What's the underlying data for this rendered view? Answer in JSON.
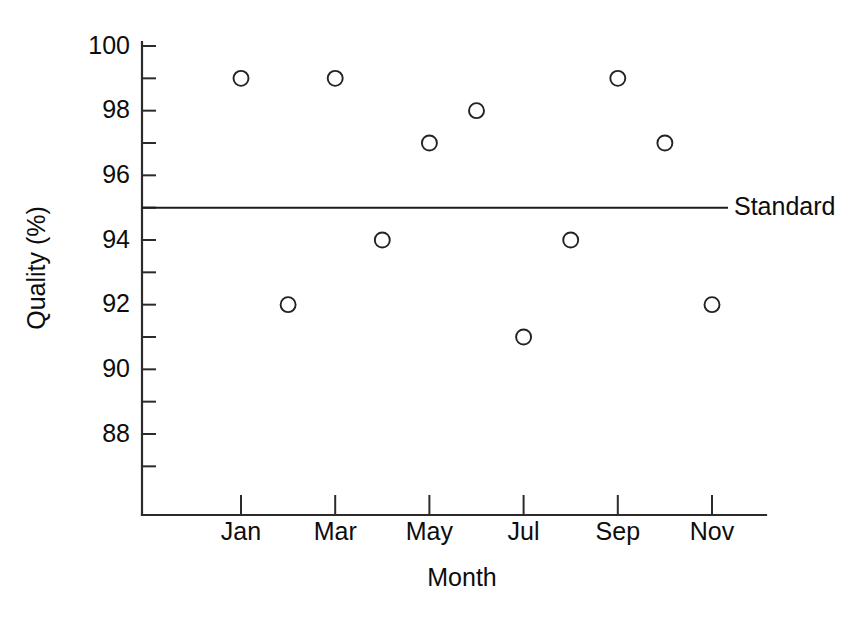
{
  "chart_data": {
    "type": "scatter",
    "title": "",
    "xlabel": "Month",
    "ylabel": "Quality (%)",
    "categories": [
      "Jan",
      "Feb",
      "Mar",
      "Apr",
      "May",
      "Jun",
      "Jul",
      "Aug",
      "Sep",
      "Oct",
      "Nov"
    ],
    "values": [
      99,
      92,
      99,
      94,
      97,
      98,
      91,
      94,
      99,
      97,
      92
    ],
    "series": [
      {
        "name": "Quality",
        "points": [
          {
            "month": "Jan",
            "month_index": 1,
            "value": 99
          },
          {
            "month": "Feb",
            "month_index": 2,
            "value": 92
          },
          {
            "month": "Mar",
            "month_index": 3,
            "value": 99
          },
          {
            "month": "Apr",
            "month_index": 4,
            "value": 94
          },
          {
            "month": "May",
            "month_index": 5,
            "value": 97
          },
          {
            "month": "Jun",
            "month_index": 6,
            "value": 98
          },
          {
            "month": "Jul",
            "month_index": 7,
            "value": 91
          },
          {
            "month": "Aug",
            "month_index": 8,
            "value": 94
          },
          {
            "month": "Sep",
            "month_index": 9,
            "value": 99
          },
          {
            "month": "Oct",
            "month_index": 10,
            "value": 97
          },
          {
            "month": "Nov",
            "month_index": 11,
            "value": 92
          }
        ]
      }
    ],
    "ylim": [
      86.8,
      100.4
    ],
    "xlim": [
      0.0,
      12.2
    ],
    "ytick_labels": [
      "88",
      "90",
      "92",
      "94",
      "96",
      "98",
      "100"
    ],
    "ytick_values": [
      88,
      90,
      92,
      94,
      96,
      98,
      100
    ],
    "yminor_values": [
      87,
      89,
      91,
      93,
      95,
      97,
      99
    ],
    "xtick_labels": [
      "Jan",
      "Mar",
      "May",
      "Jul",
      "Sep",
      "Nov"
    ],
    "xtick_values": [
      1,
      3,
      5,
      7,
      9,
      11
    ],
    "grid": false,
    "legend_position": "none",
    "reference_line": {
      "label": "Standard",
      "value": 95,
      "orientation": "horizontal"
    },
    "marker_style": "open-circle",
    "colors": {
      "axis": "#2b2b2b",
      "marker_stroke": "#222222",
      "reference_line": "#1d1d1d",
      "text": "#0d0d0d",
      "background": "#ffffff"
    }
  }
}
